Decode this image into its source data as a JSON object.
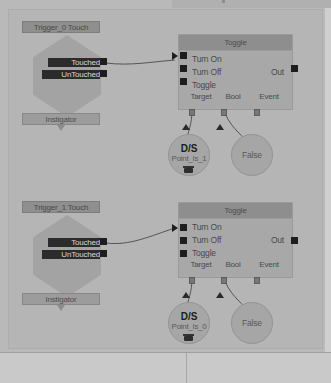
{
  "editor": {
    "name": "kismet-graph-editor",
    "background_color": "#b5b5b5",
    "node_fill_color": "#a8a8a8",
    "node_title_color": "#8e8e8e",
    "pin_color": "#1e1e1e"
  },
  "graph": {
    "nodes": [
      {
        "id": "trigger_0_touch",
        "type": "event",
        "title": "Trigger_0 Touch",
        "output_pins": [
          {
            "label": "Touched",
            "selected": true
          },
          {
            "label": "UnTouched",
            "selected": true
          }
        ],
        "variable_pins": [
          {
            "label": "Instigator"
          }
        ]
      },
      {
        "id": "toggle_0",
        "type": "action",
        "title": "Toggle",
        "input_pins": [
          {
            "label": "Turn On",
            "connected": true
          },
          {
            "label": "Turn Off",
            "connected": false
          },
          {
            "label": "Toggle",
            "connected": false
          }
        ],
        "output_pins": [
          {
            "label": "Out"
          }
        ],
        "variable_pins": [
          {
            "label": "Target",
            "connected": true
          },
          {
            "label": "Bool",
            "connected": true
          },
          {
            "label": "Event",
            "connected": false
          }
        ]
      },
      {
        "id": "object_var_0",
        "type": "variable",
        "badge": "D/S",
        "label": "Point_Is_1",
        "text": ""
      },
      {
        "id": "bool_var_0",
        "type": "variable",
        "badge": "",
        "label": "",
        "text": "False"
      },
      {
        "id": "trigger_1_touch",
        "type": "event",
        "title": "Trigger_1 Touch",
        "output_pins": [
          {
            "label": "Touched",
            "selected": true
          },
          {
            "label": "UnTouched",
            "selected": true
          }
        ],
        "variable_pins": [
          {
            "label": "Instigator"
          }
        ]
      },
      {
        "id": "toggle_1",
        "type": "action",
        "title": "Toggle",
        "input_pins": [
          {
            "label": "Turn On",
            "connected": true
          },
          {
            "label": "Turn Off",
            "connected": false
          },
          {
            "label": "Toggle",
            "connected": false
          }
        ],
        "output_pins": [
          {
            "label": "Out"
          }
        ],
        "variable_pins": [
          {
            "label": "Target",
            "connected": true
          },
          {
            "label": "Bool",
            "connected": true
          },
          {
            "label": "Event",
            "connected": false
          }
        ]
      },
      {
        "id": "object_var_1",
        "type": "variable",
        "badge": "D/S",
        "label": "Point_Is_0",
        "text": ""
      },
      {
        "id": "bool_var_1",
        "type": "variable",
        "badge": "",
        "label": "",
        "text": "False"
      }
    ]
  }
}
